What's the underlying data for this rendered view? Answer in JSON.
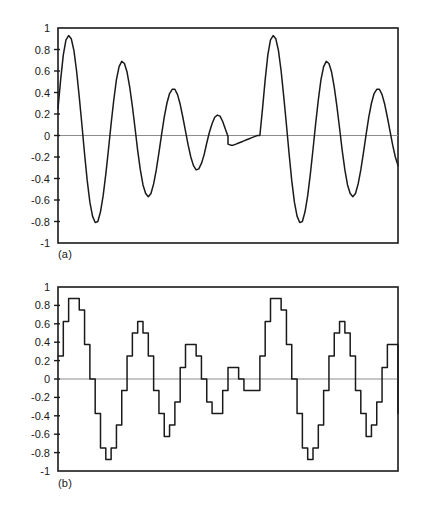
{
  "figure": {
    "background": "#ffffff",
    "trace_color": "#1a1a1a",
    "frame_color": "#1a1a1a",
    "zero_line_color": "#8c8c8c",
    "panels": [
      {
        "id": "a",
        "caption": "(a)"
      },
      {
        "id": "b",
        "caption": "(b)"
      }
    ]
  },
  "chart_data": [
    {
      "type": "line",
      "panel": "a",
      "title": "",
      "subtitle": "",
      "annotation": "(a)",
      "xlabel": "",
      "ylabel": "",
      "ylim": [
        -1,
        1
      ],
      "xlim": [
        0,
        256
      ],
      "grid": false,
      "legend": null,
      "ytick_labels": [
        "1",
        "0.8",
        "0.6",
        "0.4",
        "0.2",
        "0",
        "-0.2",
        "-0.4",
        "-0.6",
        "-0.8",
        "-1"
      ],
      "ytick_values": [
        1,
        0.8,
        0.6,
        0.4,
        0.2,
        0,
        -0.2,
        -0.4,
        -0.6,
        -0.8,
        -1
      ],
      "xtick_labels": [],
      "zero_line": 0,
      "description": "Continuous damped oscillating waveform, two identical repetitions",
      "series": [
        {
          "name": "analog-waveform",
          "x": [
            0,
            2,
            4,
            6,
            8,
            10,
            12,
            14,
            16,
            18,
            20,
            22,
            24,
            26,
            28,
            30,
            32,
            34,
            36,
            38,
            40,
            42,
            44,
            46,
            48,
            50,
            52,
            54,
            56,
            58,
            60,
            62,
            64,
            66,
            68,
            70,
            72,
            74,
            76,
            78,
            80,
            82,
            84,
            86,
            88,
            90,
            92,
            94,
            96,
            98,
            100,
            102,
            104,
            106,
            108,
            110,
            112,
            114,
            116,
            118,
            120,
            122,
            124,
            126,
            128,
            128,
            130,
            132,
            134,
            136,
            138,
            140,
            142,
            144,
            146,
            148,
            150,
            152,
            154,
            156,
            158,
            160,
            162,
            164,
            166,
            168,
            170,
            172,
            174,
            176,
            178,
            180,
            182,
            184,
            186,
            188,
            190,
            192,
            194,
            196,
            198,
            200,
            202,
            204,
            206,
            208,
            210,
            212,
            214,
            216,
            218,
            220,
            222,
            224,
            226,
            228,
            230,
            232,
            234,
            236,
            238,
            240,
            242,
            244,
            246,
            248,
            250,
            252,
            254,
            256
          ],
          "y": [
            0.25,
            0.52,
            0.75,
            0.89,
            0.93,
            0.9,
            0.79,
            0.6,
            0.36,
            0.1,
            -0.17,
            -0.42,
            -0.62,
            -0.75,
            -0.81,
            -0.8,
            -0.71,
            -0.56,
            -0.36,
            -0.13,
            0.11,
            0.33,
            0.52,
            0.64,
            0.69,
            0.67,
            0.59,
            0.45,
            0.27,
            0.07,
            -0.14,
            -0.32,
            -0.46,
            -0.54,
            -0.57,
            -0.54,
            -0.45,
            -0.32,
            -0.16,
            0.01,
            0.17,
            0.3,
            0.39,
            0.43,
            0.43,
            0.38,
            0.29,
            0.17,
            0.04,
            -0.09,
            -0.2,
            -0.28,
            -0.32,
            -0.31,
            -0.26,
            -0.18,
            -0.07,
            0.03,
            0.11,
            0.17,
            0.19,
            0.18,
            0.13,
            0.06,
            -0.01,
            -0.08,
            -0.09,
            -0.09,
            -0.08,
            -0.07,
            -0.06,
            -0.05,
            -0.04,
            -0.03,
            -0.02,
            -0.01,
            0.0,
            0.0,
            0.25,
            0.52,
            0.75,
            0.89,
            0.93,
            0.9,
            0.79,
            0.6,
            0.36,
            0.1,
            -0.17,
            -0.42,
            -0.62,
            -0.75,
            -0.81,
            -0.8,
            -0.71,
            -0.56,
            -0.36,
            -0.13,
            0.11,
            0.33,
            0.52,
            0.64,
            0.69,
            0.67,
            0.59,
            0.45,
            0.27,
            0.07,
            -0.14,
            -0.32,
            -0.46,
            -0.54,
            -0.57,
            -0.54,
            -0.45,
            -0.32,
            -0.16,
            0.01,
            0.17,
            0.3,
            0.39,
            0.43,
            0.43,
            0.38,
            0.29,
            0.17,
            0.04,
            -0.09,
            -0.2,
            -0.28,
            -0.32,
            -0.31,
            -0.26,
            -0.18,
            -0.07,
            0.03,
            0.11,
            0.17,
            0.19,
            0.18,
            0.13,
            0.06,
            -0.01,
            -0.08,
            -0.09,
            -0.07,
            -0.05,
            -0.03,
            -0.01
          ]
        }
      ]
    },
    {
      "type": "line",
      "panel": "b",
      "title": "",
      "subtitle": "",
      "annotation": "(b)",
      "xlabel": "",
      "ylabel": "",
      "ylim": [
        -1,
        1
      ],
      "xlim": [
        0,
        256
      ],
      "grid": false,
      "legend": null,
      "ytick_labels": [
        "1",
        "0.8",
        "0.6",
        "0.4",
        "0.2",
        "0",
        "-0.2",
        "-0.4",
        "-0.6",
        "-0.8",
        "-1"
      ],
      "ytick_values": [
        1,
        0.8,
        0.6,
        0.4,
        0.2,
        0,
        -0.2,
        -0.4,
        -0.6,
        -0.8,
        -1
      ],
      "xtick_labels": [],
      "zero_line": 0,
      "quantization_step": 0.125,
      "description": "Quantized staircase version of the waveform in panel (a), two identical repetitions",
      "series": [
        {
          "name": "quantized-waveform",
          "step": "pre",
          "x": [
            0,
            4,
            8,
            12,
            16,
            20,
            24,
            28,
            32,
            36,
            40,
            44,
            48,
            52,
            56,
            60,
            64,
            68,
            72,
            76,
            80,
            84,
            88,
            92,
            96,
            100,
            104,
            108,
            112,
            116,
            120,
            124,
            128,
            132,
            136,
            140,
            144,
            148,
            152,
            156,
            160,
            164,
            168,
            172,
            176,
            180,
            184,
            188,
            192,
            196,
            200,
            204,
            208,
            212,
            216,
            220,
            224,
            228,
            232,
            236,
            240,
            244,
            248,
            252,
            256
          ],
          "y": [
            0.25,
            0.625,
            0.875,
            0.875,
            0.75,
            0.375,
            0.0,
            -0.375,
            -0.75,
            -0.875,
            -0.75,
            -0.5,
            -0.125,
            0.25,
            0.5,
            0.625,
            0.5,
            0.25,
            -0.125,
            -0.375,
            -0.625,
            -0.5,
            -0.25,
            0.125,
            0.375,
            0.375,
            0.25,
            0.0,
            -0.25,
            -0.375,
            -0.375,
            -0.125,
            0.125,
            0.125,
            0.0,
            -0.125,
            -0.125,
            -0.125,
            0.25,
            0.625,
            0.875,
            0.875,
            0.75,
            0.375,
            0.0,
            -0.375,
            -0.75,
            -0.875,
            -0.75,
            -0.5,
            -0.125,
            0.25,
            0.5,
            0.625,
            0.5,
            0.25,
            -0.125,
            -0.375,
            -0.625,
            -0.5,
            -0.25,
            0.125,
            0.375,
            0.375,
            0.25,
            0.0,
            -0.25,
            -0.375,
            -0.375,
            -0.125,
            0.125,
            0.125,
            0.0,
            -0.125,
            -0.125
          ]
        }
      ]
    }
  ]
}
